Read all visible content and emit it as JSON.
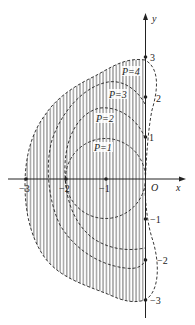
{
  "diagram": {
    "axes": {
      "x_label": "x",
      "y_label": "y",
      "origin_label": "O",
      "x_ticks": [
        {
          "value": -3,
          "label": "−3"
        },
        {
          "value": -2,
          "label": "−2"
        },
        {
          "value": -1,
          "label": "−1"
        }
      ],
      "y_ticks": [
        {
          "value": 3,
          "label": "3"
        },
        {
          "value": 2,
          "label": "2"
        },
        {
          "value": 1,
          "label": "1"
        },
        {
          "value": -1,
          "label": "−1"
        },
        {
          "value": -2,
          "label": "−2"
        },
        {
          "value": -3,
          "label": "−3"
        }
      ]
    },
    "curves": [
      {
        "label": "P=1"
      },
      {
        "label": "P=2"
      },
      {
        "label": "P=3"
      },
      {
        "label": "P=4"
      }
    ],
    "shading": "vertical hatching inside outer boundary (P=4 region)",
    "colors": {
      "line": "#222222",
      "hatch": "#555555",
      "background": "#ffffff"
    }
  }
}
